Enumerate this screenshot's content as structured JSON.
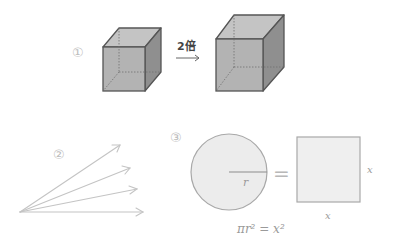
{
  "panels": [
    {
      "id": 1,
      "marker": "①",
      "arrow_label": "2倍",
      "description": "cube scaled by factor 2"
    },
    {
      "id": 2,
      "marker": "②",
      "description": "fan of arrows from a single point"
    },
    {
      "id": 3,
      "marker": "③",
      "equals": "=",
      "circle_radius_label": "r",
      "square_side_label_right": "x",
      "square_side_label_bottom": "x",
      "formula": "πr² = x²"
    }
  ],
  "colors": {
    "cube_front": "#b3b3b3",
    "cube_top": "#c4c4c4",
    "cube_side": "#8f8f8f",
    "cube_edge": "#555555",
    "circle_fill": "#ececec",
    "square_fill": "#efefef",
    "light_stroke": "#bcbcbc"
  }
}
